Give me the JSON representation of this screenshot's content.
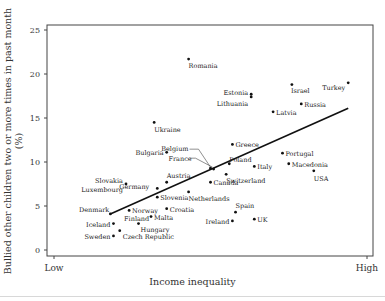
{
  "chart_data": {
    "type": "scatter",
    "title": "",
    "xlabel": "Income inequality",
    "ylabel": "Bullied other children two or more times in past month (%)",
    "x_tick_labels": [
      "Low",
      "High"
    ],
    "xlim": [
      0,
      1
    ],
    "ylim": [
      0,
      25
    ],
    "y_ticks": [
      0,
      5,
      10,
      15,
      20,
      25
    ],
    "grid": false,
    "legend": null,
    "points": [
      {
        "label": "Romania",
        "x": 0.43,
        "y": 21.7
      },
      {
        "label": "Estonia",
        "x": 0.63,
        "y": 17.7
      },
      {
        "label": "Lithuania",
        "x": 0.63,
        "y": 17.4
      },
      {
        "label": "Israel",
        "x": 0.76,
        "y": 18.8
      },
      {
        "label": "Turkey",
        "x": 0.94,
        "y": 19.0
      },
      {
        "label": "Russia",
        "x": 0.79,
        "y": 16.6
      },
      {
        "label": "Latvia",
        "x": 0.7,
        "y": 15.7
      },
      {
        "label": "Ukraine",
        "x": 0.32,
        "y": 14.5
      },
      {
        "label": "Greece",
        "x": 0.57,
        "y": 12.0
      },
      {
        "label": "Bulgaria",
        "x": 0.36,
        "y": 11.1
      },
      {
        "label": "Portugal",
        "x": 0.73,
        "y": 11.0
      },
      {
        "label": "Macedonia",
        "x": 0.75,
        "y": 9.8
      },
      {
        "label": "USA",
        "x": 0.83,
        "y": 9.0
      },
      {
        "label": "Belgium",
        "x": 0.5,
        "y": 9.3
      },
      {
        "label": "France",
        "x": 0.51,
        "y": 9.2
      },
      {
        "label": "Poland",
        "x": 0.56,
        "y": 9.8
      },
      {
        "label": "Italy",
        "x": 0.64,
        "y": 9.5
      },
      {
        "label": "Switzerland",
        "x": 0.55,
        "y": 8.6
      },
      {
        "label": "Canada",
        "x": 0.5,
        "y": 7.7
      },
      {
        "label": "Slovakia",
        "x": 0.23,
        "y": 7.5
      },
      {
        "label": "Luxembourg",
        "x": 0.23,
        "y": 7.5
      },
      {
        "label": "Germany",
        "x": 0.33,
        "y": 7.0
      },
      {
        "label": "Austria",
        "x": 0.36,
        "y": 7.7
      },
      {
        "label": "Slovenia",
        "x": 0.33,
        "y": 6.0
      },
      {
        "label": "Netherlands",
        "x": 0.43,
        "y": 6.6
      },
      {
        "label": "Denmark",
        "x": 0.18,
        "y": 4.1
      },
      {
        "label": "Norway",
        "x": 0.24,
        "y": 4.5
      },
      {
        "label": "Finland",
        "x": 0.24,
        "y": 4.5
      },
      {
        "label": "Croatia",
        "x": 0.36,
        "y": 4.7
      },
      {
        "label": "Malta",
        "x": 0.31,
        "y": 3.8
      },
      {
        "label": "Iceland",
        "x": 0.19,
        "y": 3.0
      },
      {
        "label": "Hungary",
        "x": 0.27,
        "y": 3.0
      },
      {
        "label": "Sweden",
        "x": 0.19,
        "y": 1.6
      },
      {
        "label": "Czech Republic",
        "x": 0.21,
        "y": 2.2
      },
      {
        "label": "Spain",
        "x": 0.58,
        "y": 4.3
      },
      {
        "label": "Ireland",
        "x": 0.57,
        "y": 3.3
      },
      {
        "label": "UK",
        "x": 0.64,
        "y": 3.5
      }
    ],
    "trend_line": {
      "x": [
        0.18,
        0.94
      ],
      "y": [
        4.1,
        16.1
      ]
    }
  }
}
